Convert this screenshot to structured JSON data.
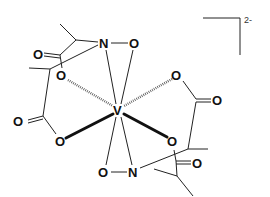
{
  "diagram": {
    "type": "chemical-structure",
    "central_atom": "V",
    "charge": "2-",
    "atoms": {
      "v": "V",
      "n_top": "N",
      "o_n_top": "O",
      "n_bottom": "N",
      "o_n_bottom": "O",
      "o_upper_left": "O",
      "o_upper_right": "O",
      "o_lower_left": "O",
      "o_lower_right": "O",
      "o_carbonyl_1": "O",
      "o_carbonyl_2": "O",
      "o_carbonyl_3": "O",
      "o_carbonyl_4": "O"
    }
  }
}
